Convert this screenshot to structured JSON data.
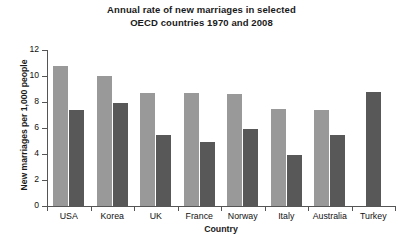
{
  "chart_data": {
    "type": "bar",
    "title": "Annual rate of new marriages in selected OECD countries 1970 and 2008",
    "title_lines": [
      "Annual rate of new marriages in selected",
      "OECD countries 1970 and 2008"
    ],
    "xlabel": "Country",
    "ylabel": "New marriages per 1,000 people",
    "categories": [
      "USA",
      "Korea",
      "UK",
      "France",
      "Norway",
      "Italy",
      "Australia",
      "Turkey"
    ],
    "series": [
      {
        "name": "1970",
        "color": "#999999",
        "values": [
          10.8,
          10.0,
          8.7,
          8.7,
          8.6,
          7.5,
          7.4,
          null
        ]
      },
      {
        "name": "2008",
        "color": "#585858",
        "values": [
          7.4,
          7.9,
          5.5,
          4.9,
          5.9,
          3.9,
          5.5,
          8.8
        ]
      }
    ],
    "ylim": [
      0,
      12
    ],
    "yticks": [
      0,
      2,
      4,
      6,
      8,
      10,
      12
    ],
    "ytick_labels": [
      "0",
      "2",
      "4",
      "6",
      "8",
      "10",
      "12"
    ],
    "grid": false,
    "legend": "none",
    "axis_color": "#555555",
    "background": "#ffffff"
  }
}
